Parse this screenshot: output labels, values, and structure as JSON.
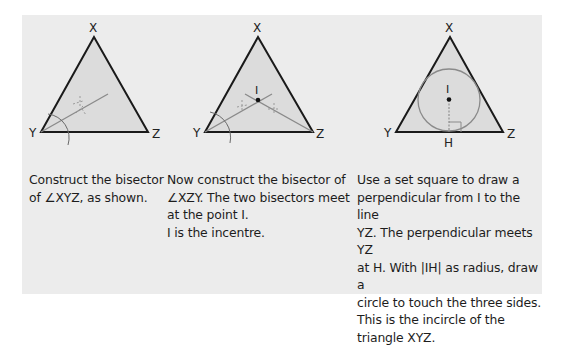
{
  "panel": {
    "background": "#ececec",
    "triangle_fill": "#dcdcdc",
    "line_color": "#1a1a1a",
    "construction_color": "#8a8a8a"
  },
  "steps": [
    {
      "labels": {
        "x": "X",
        "y": "Y",
        "z": "Z"
      },
      "caption": [
        "Construct the bisector",
        "of ∠XYZ, as shown."
      ]
    },
    {
      "labels": {
        "x": "X",
        "y": "Y",
        "z": "Z",
        "i": "I"
      },
      "caption": [
        "Now construct the bisector of",
        "∠XZY. The two bisectors meet",
        "at the point I.",
        "I is the incentre."
      ]
    },
    {
      "labels": {
        "x": "X",
        "y": "Y",
        "z": "Z",
        "i": "I",
        "h": "H"
      },
      "caption": [
        "Use a set square to draw a",
        "perpendicular from I to the line",
        "YZ. The perpendicular meets YZ",
        "at H. With |IH| as radius, draw a",
        "circle to touch the three sides.",
        "This is the incircle of the",
        "triangle XYZ."
      ]
    }
  ]
}
